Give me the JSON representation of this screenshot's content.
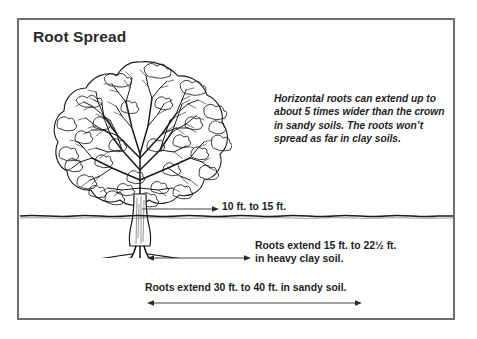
{
  "figure": {
    "title": "Root Spread",
    "border_color": "#6e6e6e",
    "background_color": "#ffffff",
    "ink_color": "#1d1d1d"
  },
  "illustration": {
    "tree_icon": "deciduous-tree-line-drawing",
    "ground_icon": "soil-surface-line",
    "root_icon": "tree-root-system"
  },
  "notes": {
    "crown_note": "Horizontal roots can extend up to about 5 times wider than the crown in sandy soils. The roots won’t spread as far in clay soils."
  },
  "measurements": [
    {
      "id": "crown-width",
      "label": "10 ft. to 15 ft.",
      "arrow": "single-headed-right-arrow"
    },
    {
      "id": "clay-spread",
      "label_line1": "Roots extend 15 ft. to 22½ ft.",
      "label_line2": "in heavy clay soil.",
      "arrow": "double-headed-arrow"
    },
    {
      "id": "sandy-spread",
      "label": "Roots extend 30 ft. to 40 ft. in sandy soil.",
      "arrow": "double-headed-arrow"
    }
  ]
}
